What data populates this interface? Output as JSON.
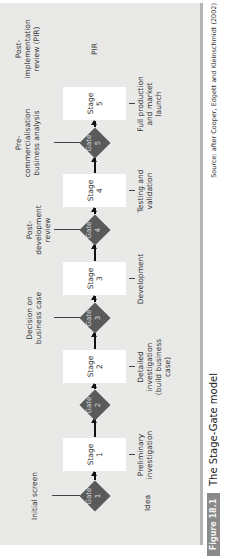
{
  "figure": {
    "badge": "Figure 18.1",
    "title": "The Stage-Gate model",
    "source": "Source: after Cooper, Edgett and Kleinschmidt (2002)"
  },
  "start_label": "Idea",
  "end_label": "PIR",
  "gates": [
    {
      "label": "Gate",
      "number": "1",
      "review": "Initial screen"
    },
    {
      "label": "Gate",
      "number": "2",
      "review": ""
    },
    {
      "label": "Gate",
      "number": "3",
      "review": "Decision on business case"
    },
    {
      "label": "Gate",
      "number": "4",
      "review": "Post-development review"
    },
    {
      "label": "Gate",
      "number": "5",
      "review": "Pre-commercialisation business analysis"
    }
  ],
  "final_review": "Post-implementation review (PIR)",
  "stages": [
    {
      "label": "Stage",
      "number": "1",
      "description": "Preliminary investigation"
    },
    {
      "label": "Stage",
      "number": "2",
      "description": "Detailed investigation (build business case)"
    },
    {
      "label": "Stage",
      "number": "3",
      "description": "Development"
    },
    {
      "label": "Stage",
      "number": "4",
      "description": "Testing and validation"
    },
    {
      "label": "Stage",
      "number": "5",
      "description": "Full production and market launch"
    }
  ],
  "colors": {
    "panel": "#e9e9e8",
    "gate": "#5a5a5a",
    "stage_box": "#ffffff",
    "badge": "#8a8a8a"
  }
}
